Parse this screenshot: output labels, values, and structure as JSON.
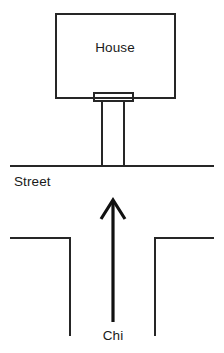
{
  "diagram": {
    "background_color": "#ffffff",
    "line_color": "#262626",
    "arrow_color": "#111111",
    "text_color": "#1a1a1a",
    "labels": {
      "house": "House",
      "street": "Street",
      "chi": "Chi"
    },
    "shapes": {
      "house_rect": {
        "name": "house-outline",
        "x": 55,
        "y": 13,
        "width": 121,
        "height": 86
      },
      "door_rect": {
        "name": "front-door",
        "x": 93,
        "y": 92,
        "width": 40,
        "height": 10
      },
      "driveway": {
        "name": "driveway",
        "left_x": 102,
        "right_x": 124,
        "top_y": 101,
        "bottom_y": 166
      },
      "street_line": {
        "name": "street-line",
        "x1": 10,
        "y1": 166,
        "x2": 214,
        "y2": 166
      },
      "road_left": {
        "name": "road-left-edge",
        "h_x1": 10,
        "h_x2": 70,
        "h_y": 238,
        "v_x": 70,
        "v_y1": 238,
        "v_y2": 336
      },
      "road_right": {
        "name": "road-right-edge",
        "h_x1": 155,
        "h_x2": 214,
        "h_y": 238,
        "v_x": 155,
        "v_y1": 238,
        "v_y2": 336
      },
      "chi_arrow": {
        "name": "chi-arrow",
        "shaft_x": 113,
        "tip_y": 200,
        "tail_y": 322,
        "head_left_x": 101,
        "head_right_x": 125,
        "head_bottom_y": 219
      }
    },
    "text_positions": {
      "house": {
        "x": 115,
        "y": 52
      },
      "street": {
        "x": 14,
        "y": 186
      },
      "chi": {
        "x": 113,
        "y": 340
      }
    }
  }
}
